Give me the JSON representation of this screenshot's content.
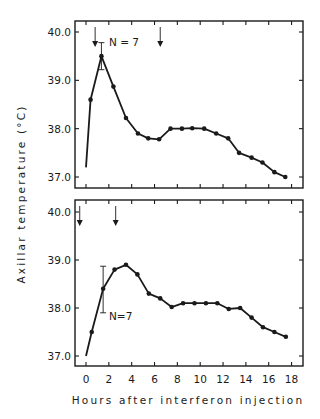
{
  "figure": {
    "ylabel": "Axillar   temperature   (°C)",
    "xlabel": "Hours  after  interferon  injection",
    "colors": {
      "ink": "#1a1a1a",
      "background": "#ffffff"
    }
  },
  "chart_data": [
    {
      "type": "line",
      "panel": "top",
      "title": "",
      "xlabel": "Hours after interferon injection",
      "ylabel": "Axillar temperature (°C)",
      "xlim": [
        -1,
        19
      ],
      "ylim": [
        36.77,
        40.23
      ],
      "xticks": [
        0,
        2,
        4,
        6,
        8,
        10,
        12,
        14,
        16,
        18
      ],
      "yticks": [
        37.0,
        38.0,
        39.0,
        40.0
      ],
      "ytick_labels": [
        "37.0",
        "38.0",
        "39.0",
        "40.0"
      ],
      "grid": false,
      "annotation": "N = 7",
      "injection_arrows_hours": [
        0.8,
        6.5
      ],
      "series": [
        {
          "name": "mean axillar temperature",
          "start_point": {
            "x": 0,
            "y": 37.2,
            "marker": false
          },
          "x": [
            0.4,
            1.35,
            2.4,
            3.5,
            4.55,
            5.45,
            6.4,
            7.4,
            8.4,
            9.3,
            10.35,
            11.4,
            12.45,
            13.4,
            14.5,
            15.45,
            16.5,
            17.45
          ],
          "y": [
            38.6,
            39.5,
            38.87,
            38.22,
            37.9,
            37.8,
            37.78,
            38.0,
            38.0,
            38.01,
            38.0,
            37.9,
            37.8,
            37.5,
            37.4,
            37.3,
            37.1,
            37.0
          ]
        }
      ],
      "error_bars": [
        {
          "x": 1.35,
          "low": 39.22,
          "high": 39.78
        }
      ]
    },
    {
      "type": "line",
      "panel": "bottom",
      "title": "",
      "xlabel": "Hours after interferon injection",
      "ylabel": "Axillar temperature (°C)",
      "xlim": [
        -1,
        19
      ],
      "ylim": [
        36.77,
        40.23
      ],
      "xticks": [
        0,
        2,
        4,
        6,
        8,
        10,
        12,
        14,
        16,
        18
      ],
      "xtick_labels": [
        "0",
        "2",
        "4",
        "6",
        "8",
        "10",
        "12",
        "14",
        "16",
        "18"
      ],
      "yticks": [
        37.0,
        38.0,
        39.0,
        40.0
      ],
      "ytick_labels": [
        "37.0",
        "38.0",
        "39.0",
        "40.0"
      ],
      "grid": false,
      "annotation": "N=7",
      "injection_arrows_hours": [
        -0.55,
        2.6
      ],
      "series": [
        {
          "name": "mean axillar temperature",
          "start_point": {
            "x": 0,
            "y": 37.0,
            "marker": false
          },
          "x": [
            0.5,
            1.5,
            2.5,
            3.5,
            4.5,
            5.5,
            6.5,
            7.5,
            8.5,
            9.5,
            10.5,
            11.5,
            12.5,
            13.5,
            14.5,
            15.5,
            16.5,
            17.5
          ],
          "y": [
            37.5,
            38.4,
            38.8,
            38.9,
            38.7,
            38.3,
            38.2,
            38.02,
            38.1,
            38.1,
            38.1,
            38.1,
            37.98,
            38.0,
            37.8,
            37.6,
            37.5,
            37.4
          ]
        }
      ],
      "error_bars": [
        {
          "x": 1.5,
          "low": 37.9,
          "high": 38.87
        }
      ]
    }
  ]
}
